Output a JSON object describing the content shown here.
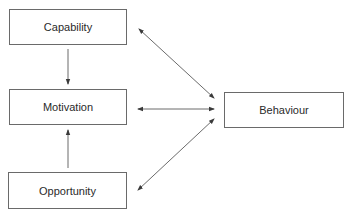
{
  "diagram": {
    "nodes": [
      {
        "id": "capability",
        "label": "Capability"
      },
      {
        "id": "motivation",
        "label": "Motivation"
      },
      {
        "id": "opportunity",
        "label": "Opportunity"
      },
      {
        "id": "behaviour",
        "label": "Behaviour"
      }
    ],
    "edges": [
      {
        "from": "capability",
        "to": "motivation",
        "direction": "one-way"
      },
      {
        "from": "opportunity",
        "to": "motivation",
        "direction": "one-way"
      },
      {
        "from": "capability",
        "to": "behaviour",
        "direction": "two-way"
      },
      {
        "from": "motivation",
        "to": "behaviour",
        "direction": "two-way"
      },
      {
        "from": "opportunity",
        "to": "behaviour",
        "direction": "two-way"
      }
    ],
    "colors": {
      "line": "#5a5a5a",
      "border": "#6a6a6a",
      "text": "#2a2a2a"
    }
  }
}
